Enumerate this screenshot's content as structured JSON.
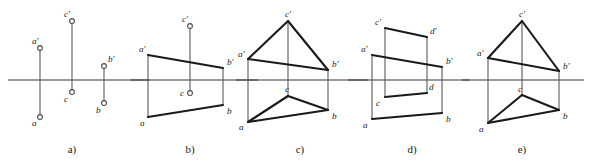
{
  "figure": {
    "width": 592,
    "height": 166,
    "background_color": "#ffffff",
    "line_color": "#1a1a1a",
    "thin_line_color": "#5a5a5a",
    "ground_line_y": 80
  },
  "panels": [
    {
      "id": "a",
      "caption": "a)",
      "caption_x": 72,
      "caption_y": 153,
      "ground_line": {
        "x1": 8,
        "x2": 150,
        "y": 80
      },
      "kind": "isolated-points",
      "points": [
        {
          "name": "a'",
          "label": "a'",
          "x": 40,
          "y": 48,
          "label_dx": -8,
          "label_dy": -4
        },
        {
          "name": "a",
          "label": "a",
          "x": 40,
          "y": 117,
          "label_dx": -8,
          "label_dy": 9
        },
        {
          "name": "c'",
          "label": "c'",
          "x": 72,
          "y": 21,
          "label_dx": -8,
          "label_dy": -4
        },
        {
          "name": "c",
          "label": "c",
          "x": 72,
          "y": 92,
          "label_dx": -8,
          "label_dy": 10
        },
        {
          "name": "b'",
          "label": "b'",
          "x": 104,
          "y": 66,
          "label_dx": 4,
          "label_dy": -4
        },
        {
          "name": "b",
          "label": "b",
          "x": 104,
          "y": 103,
          "label_dx": -8,
          "label_dy": 10
        }
      ],
      "connectors": [
        {
          "from": "a'",
          "to": "a"
        },
        {
          "from": "c'",
          "to": "c"
        },
        {
          "from": "b'",
          "to": "b"
        }
      ],
      "edges": []
    },
    {
      "id": "b",
      "caption": "b)",
      "caption_x": 190,
      "caption_y": 153,
      "ground_line": {
        "x1": 130,
        "x2": 258,
        "y": 80
      },
      "kind": "quadrilateral-top-open",
      "points": [
        {
          "name": "a'",
          "label": "a'",
          "x": 148,
          "y": 55,
          "label_dx": -9,
          "label_dy": -3
        },
        {
          "name": "a",
          "label": "a",
          "x": 148,
          "y": 117,
          "label_dx": -8,
          "label_dy": 9
        },
        {
          "name": "c'",
          "label": "c'",
          "x": 190,
          "y": 26,
          "label_dx": -8,
          "label_dy": -4,
          "marker": true
        },
        {
          "name": "c",
          "label": "c",
          "x": 190,
          "y": 93,
          "label_dx": -10,
          "label_dy": 3,
          "marker": true
        },
        {
          "name": "b'",
          "label": "b'",
          "x": 223,
          "y": 68,
          "label_dx": 4,
          "label_dy": -3
        },
        {
          "name": "b",
          "label": "b",
          "x": 223,
          "y": 105,
          "label_dx": 4,
          "label_dy": 9
        }
      ],
      "connectors": [
        {
          "from": "a'",
          "to": "a"
        },
        {
          "from": "c'",
          "to": "c"
        },
        {
          "from": "b'",
          "to": "b"
        }
      ],
      "edges": [
        {
          "from": "a'",
          "to": "b'"
        },
        {
          "from": "a",
          "to": "b"
        }
      ]
    },
    {
      "id": "c",
      "caption": "c)",
      "caption_x": 300,
      "caption_y": 153,
      "ground_line": {
        "x1": 236,
        "x2": 368,
        "y": 80
      },
      "kind": "triangles",
      "points": [
        {
          "name": "a'",
          "label": "a'",
          "x": 248,
          "y": 59,
          "label_dx": -10,
          "label_dy": -2
        },
        {
          "name": "a",
          "label": "a",
          "x": 248,
          "y": 122,
          "label_dx": -9,
          "label_dy": 8
        },
        {
          "name": "c'",
          "label": "c'",
          "x": 288,
          "y": 21,
          "label_dx": -3,
          "label_dy": -4
        },
        {
          "name": "c",
          "label": "c",
          "x": 288,
          "y": 96,
          "label_dx": -3,
          "label_dy": -4
        },
        {
          "name": "b'",
          "label": "b'",
          "x": 328,
          "y": 70,
          "label_dx": 4,
          "label_dy": -3
        },
        {
          "name": "b",
          "label": "b",
          "x": 328,
          "y": 110,
          "label_dx": 4,
          "label_dy": 9
        }
      ],
      "connectors": [
        {
          "from": "a'",
          "to": "a"
        },
        {
          "from": "c'",
          "to": "c"
        },
        {
          "from": "b'",
          "to": "b"
        }
      ],
      "edges": [
        {
          "from": "a'",
          "to": "c'"
        },
        {
          "from": "c'",
          "to": "b'"
        },
        {
          "from": "a'",
          "to": "b'"
        },
        {
          "from": "a",
          "to": "c"
        },
        {
          "from": "c",
          "to": "b"
        },
        {
          "from": "a",
          "to": "b"
        }
      ]
    },
    {
      "id": "d",
      "caption": "d)",
      "caption_x": 412,
      "caption_y": 153,
      "ground_line": {
        "x1": 348,
        "x2": 470,
        "y": 80
      },
      "kind": "quadrilaterals",
      "points": [
        {
          "name": "a'",
          "label": "a'",
          "x": 372,
          "y": 55,
          "label_dx": -11,
          "label_dy": -3
        },
        {
          "name": "a",
          "label": "a",
          "x": 372,
          "y": 119,
          "label_dx": -9,
          "label_dy": 9
        },
        {
          "name": "c'",
          "label": "c'",
          "x": 385,
          "y": 28,
          "label_dx": -10,
          "label_dy": -3
        },
        {
          "name": "c",
          "label": "c",
          "x": 385,
          "y": 97,
          "label_dx": -9,
          "label_dy": 9
        },
        {
          "name": "d'",
          "label": "d'",
          "x": 427,
          "y": 37,
          "label_dx": 3,
          "label_dy": -3
        },
        {
          "name": "d",
          "label": "d",
          "x": 427,
          "y": 93,
          "label_dx": 2,
          "label_dy": -3
        },
        {
          "name": "b'",
          "label": "b'",
          "x": 442,
          "y": 67,
          "label_dx": 4,
          "label_dy": -3
        },
        {
          "name": "b",
          "label": "b",
          "x": 442,
          "y": 113,
          "label_dx": 4,
          "label_dy": 9
        }
      ],
      "connectors": [
        {
          "from": "a'",
          "to": "a"
        },
        {
          "from": "c'",
          "to": "c"
        },
        {
          "from": "d'",
          "to": "d"
        },
        {
          "from": "b'",
          "to": "b"
        }
      ],
      "edges": [
        {
          "from": "c'",
          "to": "d'"
        },
        {
          "from": "a'",
          "to": "b'"
        },
        {
          "from": "c",
          "to": "d"
        },
        {
          "from": "a",
          "to": "b"
        }
      ]
    },
    {
      "id": "e",
      "caption": "e)",
      "caption_x": 522,
      "caption_y": 153,
      "ground_line": {
        "x1": 462,
        "x2": 584,
        "y": 80
      },
      "kind": "triangles",
      "points": [
        {
          "name": "a'",
          "label": "a'",
          "x": 488,
          "y": 58,
          "label_dx": -11,
          "label_dy": -2
        },
        {
          "name": "a",
          "label": "a",
          "x": 488,
          "y": 123,
          "label_dx": -9,
          "label_dy": 9
        },
        {
          "name": "c'",
          "label": "c'",
          "x": 522,
          "y": 21,
          "label_dx": -3,
          "label_dy": -4
        },
        {
          "name": "c",
          "label": "c",
          "x": 522,
          "y": 95,
          "label_dx": -4,
          "label_dy": -3
        },
        {
          "name": "b'",
          "label": "b'",
          "x": 559,
          "y": 71,
          "label_dx": 4,
          "label_dy": -2
        },
        {
          "name": "b",
          "label": "b",
          "x": 559,
          "y": 110,
          "label_dx": 4,
          "label_dy": 9
        }
      ],
      "connectors": [
        {
          "from": "a'",
          "to": "a"
        },
        {
          "from": "c'",
          "to": "c"
        },
        {
          "from": "b'",
          "to": "b"
        }
      ],
      "edges": [
        {
          "from": "a'",
          "to": "c'"
        },
        {
          "from": "c'",
          "to": "b'"
        },
        {
          "from": "a'",
          "to": "b'"
        },
        {
          "from": "a",
          "to": "c"
        },
        {
          "from": "c",
          "to": "b"
        },
        {
          "from": "a",
          "to": "b"
        }
      ]
    }
  ]
}
